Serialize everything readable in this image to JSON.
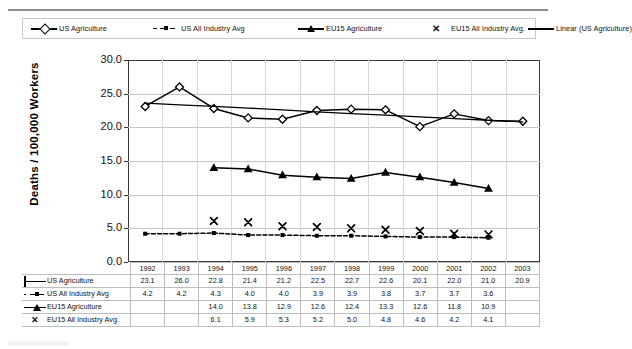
{
  "legend": {
    "items": [
      {
        "label": "US Agriculture",
        "key": "line-open-diamond"
      },
      {
        "label": "US All Industry Avg",
        "key": "dashed-filled-square"
      },
      {
        "label": "EU15 Agriculture",
        "key": "line-filled-triangle"
      },
      {
        "label": "EU15 All Industry Avg.",
        "key": "x-marker"
      },
      {
        "label": "Linear (US Agriculture)",
        "key": "plain-line"
      }
    ]
  },
  "axis": {
    "ylabel": "Deaths / 100,000 Workers",
    "yticks": [
      "0.0",
      "5.0",
      "10.0",
      "15.0",
      "20.0",
      "25.0",
      "30.0"
    ]
  },
  "table": {
    "years": [
      "1992",
      "1993",
      "1994",
      "1995",
      "1996",
      "1997",
      "1998",
      "1999",
      "2000",
      "2001",
      "2002",
      "2003"
    ],
    "rows": [
      {
        "label": "US Agriculture",
        "key": "line-open-diamond",
        "values": [
          "23.1",
          "26.0",
          "22.8",
          "21.4",
          "21.2",
          "22.5",
          "22.7",
          "22.6",
          "20.1",
          "22.0",
          "21.0",
          "20.9"
        ]
      },
      {
        "label": "US All Industry Avg",
        "key": "dashed-filled-square",
        "values": [
          "4.2",
          "4.2",
          "4.3",
          "4.0",
          "4.0",
          "3.9",
          "3.9",
          "3.8",
          "3.7",
          "3.7",
          "3.6",
          ""
        ]
      },
      {
        "label": "EU15 Agriculture",
        "key": "line-filled-triangle",
        "values": [
          "",
          "",
          "14.0",
          "13.8",
          "12.9",
          "12.6",
          "12.4",
          "13.3",
          "12.6",
          "11.8",
          "10.9",
          ""
        ]
      },
      {
        "label": "EU15 All Industry Avg.",
        "key": "x-marker",
        "values": [
          "",
          "",
          "6.1",
          "5.9",
          "5.3",
          "5.2",
          "5.0",
          "4.8",
          "4.6",
          "4.2",
          "4.1",
          ""
        ]
      }
    ]
  },
  "chart_data": {
    "type": "line",
    "title": "",
    "xlabel": "",
    "ylabel": "Deaths / 100,000 Workers",
    "ylim": [
      0,
      30
    ],
    "ytick_step": 5,
    "grid": true,
    "legend_position": "top",
    "x": [
      1992,
      1993,
      1994,
      1995,
      1996,
      1997,
      1998,
      1999,
      2000,
      2001,
      2002,
      2003
    ],
    "series": [
      {
        "name": "US Agriculture",
        "marker": "open-diamond",
        "linestyle": "solid",
        "values": [
          23.1,
          26.0,
          22.8,
          21.4,
          21.2,
          22.5,
          22.7,
          22.6,
          20.1,
          22.0,
          21.0,
          20.9
        ]
      },
      {
        "name": "US All Industry Avg",
        "marker": "filled-square",
        "linestyle": "dashed",
        "values": [
          4.2,
          4.2,
          4.3,
          4.0,
          4.0,
          3.9,
          3.9,
          3.8,
          3.7,
          3.7,
          3.6,
          null
        ]
      },
      {
        "name": "EU15 Agriculture",
        "marker": "filled-triangle",
        "linestyle": "solid",
        "values": [
          null,
          null,
          14.0,
          13.8,
          12.9,
          12.6,
          12.4,
          13.3,
          12.6,
          11.8,
          10.9,
          null
        ]
      },
      {
        "name": "EU15 All Industry Avg.",
        "marker": "x",
        "linestyle": "none",
        "values": [
          null,
          null,
          6.1,
          5.9,
          5.3,
          5.2,
          5.0,
          4.8,
          4.6,
          4.2,
          4.1,
          null
        ]
      },
      {
        "name": "Linear (US Agriculture)",
        "marker": "none",
        "linestyle": "solid",
        "trendline": true,
        "values": [
          23.6,
          23.35,
          23.1,
          22.85,
          22.6,
          22.3,
          22.05,
          21.8,
          21.55,
          21.3,
          21.05,
          20.8
        ]
      }
    ]
  }
}
